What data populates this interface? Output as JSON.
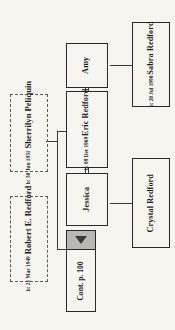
{
  "chart": {
    "type": "family-tree",
    "orientation": "rotated-90-ccw",
    "background_color": "#f7f5f0",
    "box_border_color": "#2a2a2a",
    "dashed_border_color": "#5a5a5a",
    "marker_fill_color": "#b9b9b4"
  },
  "people": {
    "amy": {
      "name": "Amy",
      "birth": ""
    },
    "eric": {
      "name": "Eric Redford",
      "birth": "b: 09 Dec 1969"
    },
    "jessica": {
      "name": "Jessica",
      "birth": ""
    },
    "sabra": {
      "name": "Sabra Redford",
      "birth": "b: 20 Jul 1990"
    },
    "crystal": {
      "name": "Crystal Redford",
      "birth": ""
    },
    "robert": {
      "name": "Robert E. Redford",
      "birth": "b: 21 Mar 1949"
    },
    "sherrilyn": {
      "name": "Sherrilyn Peliquin",
      "birth": "b: 30 Jun 1951"
    }
  },
  "continuation": {
    "label": "Cont. p. 100",
    "icon": "triangle-down-icon"
  }
}
